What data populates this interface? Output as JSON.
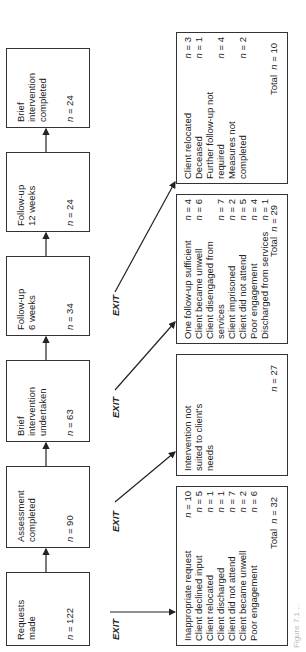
{
  "stages": [
    {
      "label": "Requests\nmade",
      "n": "122"
    },
    {
      "label": "Assessment\ncompleted",
      "n": "90"
    },
    {
      "label": "Brief\nintervention\nundertaken",
      "n": "63"
    },
    {
      "label": "Follow-up\n6 weeks",
      "n": "34"
    },
    {
      "label": "Follow-up\n12 weeks",
      "n": "24"
    },
    {
      "label": "Brief\nintervention\ncompleted",
      "n": "24"
    }
  ],
  "exit_label": "EXIT",
  "n_prefix": "n",
  "total_label": "Total",
  "exits": [
    {
      "rows": [
        {
          "label": "Inappropriate request",
          "n": "10"
        },
        {
          "label": "Client declined input",
          "n": "5"
        },
        {
          "label": "Client relocated",
          "n": "1"
        },
        {
          "label": "Client discharged",
          "n": "1"
        },
        {
          "label": "Client did not attend",
          "n": "7"
        },
        {
          "label": "Client became unwell",
          "n": "2"
        },
        {
          "label": "Poor engagement",
          "n": "6"
        }
      ],
      "total": "32"
    },
    {
      "rows": [
        {
          "label": "Intervention not\nsuited to client's\nneeds",
          "n": ""
        }
      ],
      "total": "27",
      "total_no_label": true
    },
    {
      "rows": [
        {
          "label": "One follow-up sufficient",
          "n": "4"
        },
        {
          "label": "Client became unwell",
          "n": "6"
        },
        {
          "label": "Client disengaged from\n   services",
          "n": "7"
        },
        {
          "label": "Client imprisoned",
          "n": "2"
        },
        {
          "label": "Client did not attend",
          "n": "5"
        },
        {
          "label": "Poor engagement",
          "n": "4"
        },
        {
          "label": "Discharged from services",
          "n": "1"
        }
      ],
      "total": "29"
    },
    {
      "rows": [
        {
          "label": "Client relocated",
          "n": "3"
        },
        {
          "label": "Deceased",
          "n": "1"
        },
        {
          "label": "Further follow-up not\n   required",
          "n": "4"
        },
        {
          "label": "Measures not\n   completed",
          "n": "2"
        }
      ],
      "total": "10"
    }
  ],
  "caption": "Figure 7.1 ..."
}
